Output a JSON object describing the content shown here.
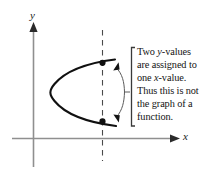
{
  "figure": {
    "background_color": "#ffffff",
    "stroke_color": "#1a1a1a",
    "axis_color": "#8a8a8a"
  },
  "axes": {
    "y_label": "y",
    "x_label": "x",
    "y_axis": {
      "x": 33,
      "top": 26,
      "bottom": 167
    },
    "x_axis": {
      "y": 138,
      "left": 12,
      "right": 179
    }
  },
  "vertical_line": {
    "name": "dashed-vertical-test-line",
    "x": 102,
    "top": 30,
    "bottom": 161,
    "style": "dashed"
  },
  "curve": {
    "name": "leftward-opening-parabola",
    "vertex": {
      "x": 51,
      "y": 92
    },
    "upper_end": {
      "x": 115,
      "y": 60
    },
    "lower_end": {
      "x": 116,
      "y": 125
    }
  },
  "points": [
    {
      "label": "upper-intersection-point",
      "x": 102,
      "y": 63
    },
    {
      "label": "lower-intersection-point",
      "x": 102,
      "y": 121
    }
  ],
  "callout": {
    "bracket_x": 131,
    "bracket_top": 47,
    "bracket_bottom": 126,
    "lines": [
      {
        "pre": "Two ",
        "em": "y",
        "post": "-values"
      },
      {
        "pre": "are assigned to",
        "em": "",
        "post": ""
      },
      {
        "pre": "one ",
        "em": "x",
        "post": "-value."
      },
      {
        "pre": "Thus this is not",
        "em": "",
        "post": ""
      },
      {
        "pre": "the graph of a",
        "em": "",
        "post": ""
      },
      {
        "pre": "function.",
        "em": "",
        "post": ""
      }
    ]
  }
}
